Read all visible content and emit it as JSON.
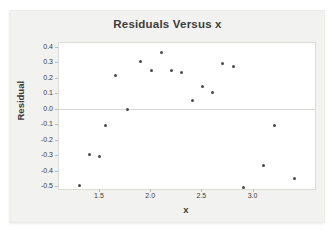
{
  "chart_data": {
    "type": "scatter",
    "title": "Residuals Versus x",
    "xlabel": "x",
    "ylabel": "Residual",
    "xlim": [
      1.1,
      3.6
    ],
    "ylim": [
      -0.51,
      0.43
    ],
    "xticks": [
      1.5,
      2.0,
      2.5,
      3.0
    ],
    "yticks": [
      0.4,
      0.3,
      0.2,
      0.1,
      0.0,
      -0.1,
      -0.2,
      -0.3,
      -0.4,
      -0.5
    ],
    "grid": "zero-reference-line-only",
    "legend": "none",
    "points": [
      {
        "x": 1.3,
        "y": -0.49
      },
      {
        "x": 1.4,
        "y": -0.29
      },
      {
        "x": 1.5,
        "y": -0.3
      },
      {
        "x": 1.55,
        "y": -0.1
      },
      {
        "x": 1.65,
        "y": 0.22
      },
      {
        "x": 1.77,
        "y": 0.0
      },
      {
        "x": 1.9,
        "y": 0.31
      },
      {
        "x": 2.0,
        "y": 0.25
      },
      {
        "x": 2.1,
        "y": 0.37
      },
      {
        "x": 2.2,
        "y": 0.25
      },
      {
        "x": 2.3,
        "y": 0.24
      },
      {
        "x": 2.4,
        "y": 0.06
      },
      {
        "x": 2.5,
        "y": 0.15
      },
      {
        "x": 2.6,
        "y": 0.11
      },
      {
        "x": 2.7,
        "y": 0.3
      },
      {
        "x": 2.8,
        "y": 0.28
      },
      {
        "x": 2.9,
        "y": -0.5
      },
      {
        "x": 3.1,
        "y": -0.36
      },
      {
        "x": 3.2,
        "y": -0.1
      },
      {
        "x": 3.4,
        "y": -0.44
      }
    ],
    "colors": {
      "point": "#4a4a4a",
      "figure_background": "#f2f2f0",
      "plot_background": "#ffffff",
      "plot_border": "#dcdcda",
      "zero_line": "#d6d6d4",
      "text": "#3d3d3d"
    }
  }
}
